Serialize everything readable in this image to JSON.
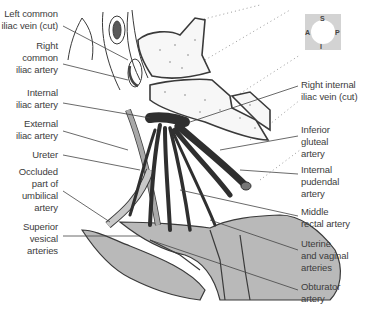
{
  "figure": {
    "type": "anatomical illustration"
  },
  "orientation": {
    "superior": "S",
    "inferior": "I",
    "anterior": "A",
    "posterior": "P"
  },
  "labels_left": [
    {
      "lines": [
        "Left common",
        "iliac vein (cut)"
      ]
    },
    {
      "lines": [
        "Right",
        "common",
        "iliac artery"
      ]
    },
    {
      "lines": [
        "Internal",
        "iliac artery"
      ]
    },
    {
      "lines": [
        "External",
        "iliac artery"
      ]
    },
    {
      "lines": [
        "Ureter"
      ]
    },
    {
      "lines": [
        "Occluded",
        "part of",
        "umbilical",
        "artery"
      ]
    },
    {
      "lines": [
        "Superior",
        "vesical",
        "arteries"
      ]
    }
  ],
  "labels_right": [
    {
      "lines": [
        "Right internal",
        "iliac vein (cut)"
      ]
    },
    {
      "lines": [
        "Inferior",
        "gluteal",
        "artery"
      ]
    },
    {
      "lines": [
        "Internal",
        "pudendal",
        "artery"
      ]
    },
    {
      "lines": [
        "Middle",
        "rectal artery"
      ]
    },
    {
      "lines": [
        "Uterine",
        "and vaginal",
        "arteries"
      ]
    },
    {
      "lines": [
        "Obturator",
        "artery"
      ]
    }
  ],
  "colors": {
    "artery": "#2f2f2f",
    "ureter": "#a9a9a9",
    "organ_fill": "#b9b9b9",
    "outline": "#3a3a3a",
    "compass_bg": "#d3d3d3"
  }
}
